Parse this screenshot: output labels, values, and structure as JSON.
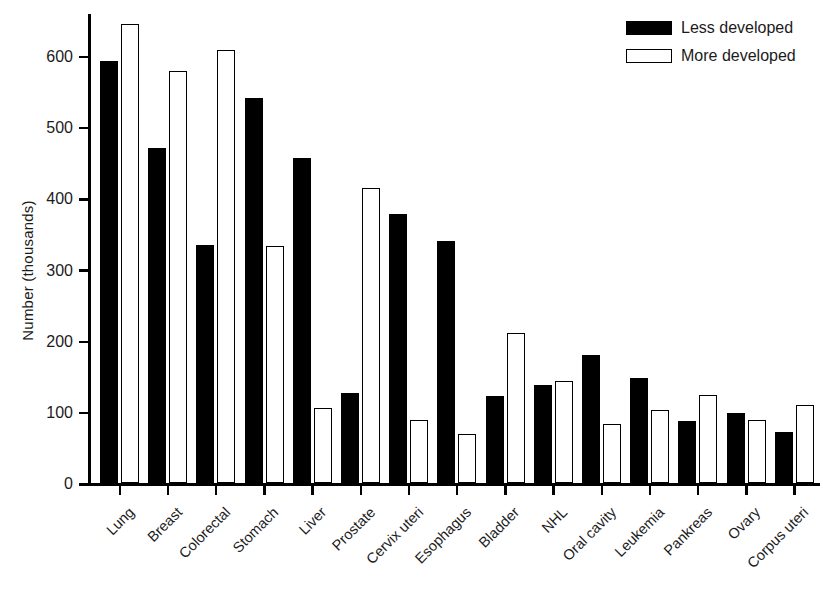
{
  "chart_data": {
    "type": "bar",
    "title": "",
    "xlabel": "",
    "ylabel": "Number  (thousands)",
    "ylim": [
      0,
      660
    ],
    "yticks": [
      0,
      100,
      200,
      300,
      400,
      500,
      600
    ],
    "ytick_labels": [
      "0",
      "100",
      "200",
      "300",
      "400",
      "500",
      "600"
    ],
    "grid": false,
    "legend_position": "top-right",
    "categories": [
      "Lung",
      "Breast",
      "Colorectal",
      "Stomach",
      "Liver",
      "Prostate",
      "Cervix uteri",
      "Esophagus",
      "Bladder",
      "NHL",
      "Oral cavity",
      "Leukemia",
      "Pankreas",
      "Ovary",
      "Corpus uteri"
    ],
    "series": [
      {
        "name": "Less developed",
        "color": "#000000",
        "style": "filled",
        "values": [
          592,
          470,
          334,
          541,
          456,
          126,
          378,
          340,
          122,
          138,
          180,
          148,
          87,
          98,
          72
        ]
      },
      {
        "name": "More developed",
        "color": "#ffffff",
        "style": "outlined",
        "values": [
          645,
          578,
          608,
          333,
          105,
          414,
          89,
          69,
          210,
          143,
          83,
          103,
          124,
          88,
          110
        ]
      }
    ]
  },
  "legend": {
    "items": [
      {
        "label": "Less developed",
        "swatch": "filled-black"
      },
      {
        "label": "More developed",
        "swatch": "outlined-white"
      }
    ]
  },
  "axes": {
    "y_title": "Number  (thousands)"
  },
  "caption": {
    "text": ""
  }
}
